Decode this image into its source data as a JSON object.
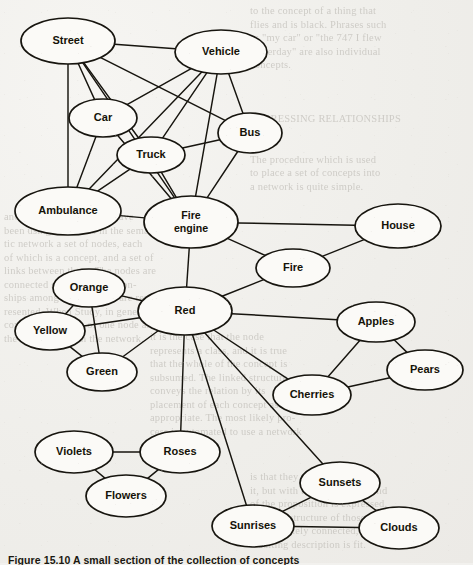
{
  "figure": {
    "caption": "Figure 15.10  A small section of the collection of concepts",
    "type": "semantic-network-diagram",
    "ink_color": "#17150f",
    "node_fill": "#fbfaf7",
    "paper_color": "#efeeea"
  },
  "graph": {
    "nodes": [
      {
        "id": "street",
        "label": "Street",
        "cx": 68,
        "cy": 41,
        "rx": 47,
        "ry": 23
      },
      {
        "id": "vehicle",
        "label": "Vehicle",
        "cx": 221,
        "cy": 52,
        "rx": 46,
        "ry": 22
      },
      {
        "id": "car",
        "label": "Car",
        "cx": 103,
        "cy": 118,
        "rx": 34,
        "ry": 19
      },
      {
        "id": "bus",
        "label": "Bus",
        "cx": 250,
        "cy": 133,
        "rx": 32,
        "ry": 20
      },
      {
        "id": "truck",
        "label": "Truck",
        "cx": 151,
        "cy": 155,
        "rx": 34,
        "ry": 18
      },
      {
        "id": "ambulance",
        "label": "Ambulance",
        "cx": 68,
        "cy": 211,
        "rx": 53,
        "ry": 24
      },
      {
        "id": "fire_engine",
        "label": "Fire engine",
        "cx": 191,
        "cy": 222,
        "rx": 47,
        "ry": 26
      },
      {
        "id": "house",
        "label": "House",
        "cx": 398,
        "cy": 226,
        "rx": 43,
        "ry": 22
      },
      {
        "id": "fire",
        "label": "Fire",
        "cx": 293,
        "cy": 268,
        "rx": 37,
        "ry": 19
      },
      {
        "id": "red",
        "label": "Red",
        "cx": 185,
        "cy": 311,
        "rx": 47,
        "ry": 24
      },
      {
        "id": "orange",
        "label": "Orange",
        "cx": 89,
        "cy": 288,
        "rx": 36,
        "ry": 19
      },
      {
        "id": "yellow",
        "label": "Yellow",
        "cx": 50,
        "cy": 331,
        "rx": 35,
        "ry": 19
      },
      {
        "id": "green",
        "label": "Green",
        "cx": 102,
        "cy": 372,
        "rx": 35,
        "ry": 19
      },
      {
        "id": "apples",
        "label": "Apples",
        "cx": 376,
        "cy": 322,
        "rx": 39,
        "ry": 20
      },
      {
        "id": "pears",
        "label": "Pears",
        "cx": 425,
        "cy": 370,
        "rx": 38,
        "ry": 20
      },
      {
        "id": "cherries",
        "label": "Cherries",
        "cx": 312,
        "cy": 395,
        "rx": 39,
        "ry": 20
      },
      {
        "id": "roses",
        "label": "Roses",
        "cx": 180,
        "cy": 452,
        "rx": 40,
        "ry": 21
      },
      {
        "id": "violets",
        "label": "Violets",
        "cx": 74,
        "cy": 452,
        "rx": 39,
        "ry": 21
      },
      {
        "id": "flowers",
        "label": "Flowers",
        "cx": 126,
        "cy": 496,
        "rx": 40,
        "ry": 21
      },
      {
        "id": "sunsets",
        "label": "Sunsets",
        "cx": 340,
        "cy": 483,
        "rx": 40,
        "ry": 21
      },
      {
        "id": "sunrises",
        "label": "Sunrises",
        "cx": 253,
        "cy": 526,
        "rx": 41,
        "ry": 21
      },
      {
        "id": "clouds",
        "label": "Clouds",
        "cx": 399,
        "cy": 528,
        "rx": 40,
        "ry": 21
      }
    ],
    "edges": [
      [
        "street",
        "vehicle"
      ],
      [
        "street",
        "car"
      ],
      [
        "street",
        "bus"
      ],
      [
        "street",
        "truck"
      ],
      [
        "street",
        "ambulance"
      ],
      [
        "street",
        "fire_engine"
      ],
      [
        "vehicle",
        "car"
      ],
      [
        "vehicle",
        "bus"
      ],
      [
        "vehicle",
        "truck"
      ],
      [
        "vehicle",
        "ambulance"
      ],
      [
        "vehicle",
        "fire_engine"
      ],
      [
        "car",
        "ambulance"
      ],
      [
        "car",
        "fire_engine"
      ],
      [
        "truck",
        "bus"
      ],
      [
        "truck",
        "fire_engine"
      ],
      [
        "truck",
        "ambulance"
      ],
      [
        "bus",
        "fire_engine"
      ],
      [
        "ambulance",
        "fire_engine"
      ],
      [
        "fire_engine",
        "house"
      ],
      [
        "fire_engine",
        "fire"
      ],
      [
        "fire_engine",
        "red"
      ],
      [
        "fire",
        "house"
      ],
      [
        "fire",
        "red"
      ],
      [
        "red",
        "orange"
      ],
      [
        "red",
        "yellow"
      ],
      [
        "red",
        "green"
      ],
      [
        "red",
        "apples"
      ],
      [
        "red",
        "cherries"
      ],
      [
        "red",
        "roses"
      ],
      [
        "red",
        "sunsets"
      ],
      [
        "red",
        "sunrises"
      ],
      [
        "orange",
        "yellow"
      ],
      [
        "orange",
        "green"
      ],
      [
        "yellow",
        "green"
      ],
      [
        "apples",
        "pears"
      ],
      [
        "apples",
        "cherries"
      ],
      [
        "cherries",
        "pears"
      ],
      [
        "roses",
        "violets"
      ],
      [
        "roses",
        "flowers"
      ],
      [
        "violets",
        "flowers"
      ],
      [
        "sunsets",
        "sunrises"
      ],
      [
        "sunsets",
        "clouds"
      ],
      [
        "sunrises",
        "clouds"
      ]
    ]
  },
  "background_text": {
    "right_column": "to the concept of a thing that\nflies and is black. Phrases such\nas \"my car\" or \"the 747 I flew\nyesterday\" are also individual\nconcepts.\n\n\n\nEXPRESSING RELATIONSHIPS\n\n\nThe procedure which is used\nto place a set of concepts into\na network is quite simple.",
    "left_column": "and conventions that we have\nbeen using. One sees in the seman-\ntic network a set of nodes, each\nof which is a concept, and a set of\nlinks between them. The nodes are\nconnected so that the relation-\nships among the concepts are rep-\nresented. When Study, in general,\ncovers the domain of one node and\nthe extension from the network.",
    "mid_column": "it is the case that the node\nrepresents a class, and it is true\nthat the whole of the concept is\nsubsumed. The linked structure\nconveys the relation by its\nplacement of each concept as\nappropriate. The most likely pro-\ncess is automated to use a network",
    "low_column": "is that they are connected to\nit, but with the detail at the end\nof the proposition is expressed.\nLike the structure of those entries\nappropriately connected, the\nresulting description is fit."
  }
}
